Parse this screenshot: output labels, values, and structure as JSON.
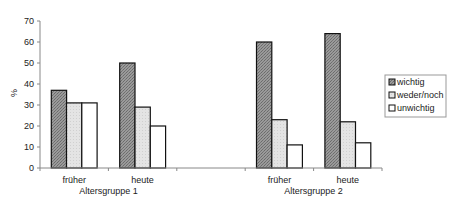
{
  "chart_data": {
    "type": "bar",
    "title": "",
    "xlabel": "",
    "ylabel": "%",
    "ylim": [
      0,
      70
    ],
    "yticks": [
      0,
      10,
      20,
      30,
      40,
      50,
      60,
      70
    ],
    "grid": false,
    "legend_position": "right",
    "groups": [
      {
        "label": "Altersgruppe 1",
        "categories": [
          "früher",
          "heute"
        ]
      },
      {
        "label": "Altersgruppe 2",
        "categories": [
          "früher",
          "heute"
        ]
      }
    ],
    "categories": [
      "früher (Altersgruppe 1)",
      "heute (Altersgruppe 1)",
      "früher (Altersgruppe 2)",
      "heute (Altersgruppe 2)"
    ],
    "series": [
      {
        "name": "wichtig",
        "values": [
          37,
          50,
          60,
          64
        ],
        "color": "#8c8c8c"
      },
      {
        "name": "weder/noch",
        "values": [
          31,
          29,
          23,
          22
        ],
        "color": "#e2e2e2"
      },
      {
        "name": "unwichtig",
        "values": [
          31,
          20,
          11,
          12
        ],
        "color": "#ffffff"
      }
    ]
  }
}
